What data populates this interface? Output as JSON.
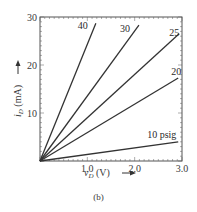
{
  "chart_data": {
    "type": "line",
    "title": "",
    "caption": "(b)",
    "xlabel": "v_D (V)",
    "ylabel": "i_D (mA)",
    "xlim": [
      0,
      3.0
    ],
    "ylim": [
      0,
      30
    ],
    "xticks": [
      "1.0",
      "2.0",
      "3.0"
    ],
    "yticks": [
      "10",
      "20",
      "30"
    ],
    "grid": false,
    "legend": "inline labels at line ends",
    "series": [
      {
        "name": "40",
        "label": "40",
        "x": [
          0,
          1.18
        ],
        "y": [
          0,
          28.7
        ]
      },
      {
        "name": "30",
        "label": "30",
        "x": [
          0,
          2.09
        ],
        "y": [
          0,
          28.3
        ]
      },
      {
        "name": "25",
        "label": "25",
        "x": [
          0,
          2.94
        ],
        "y": [
          0,
          26.5
        ]
      },
      {
        "name": "20",
        "label": "20",
        "x": [
          0,
          2.92
        ],
        "y": [
          0,
          17.3
        ]
      },
      {
        "name": "10 psig",
        "label": "10 psig",
        "x": [
          0,
          2.92
        ],
        "y": [
          0,
          4.0
        ]
      }
    ]
  },
  "labels": {
    "x_axis_main": "v",
    "x_axis_sub": "D",
    "x_axis_unit": " (V)",
    "y_axis_main": "i",
    "y_axis_sub": "D",
    "y_axis_unit": " (mA)",
    "caption": "(b)"
  }
}
